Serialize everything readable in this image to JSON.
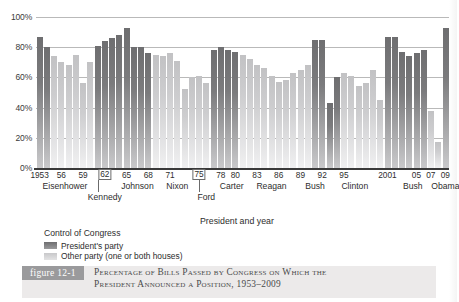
{
  "chart_data": {
    "type": "bar",
    "title": "Percentage of Bills Passed by Congress on Which the President Announced a Position, 1953–2009",
    "xlabel": "President and year",
    "ylabel": "",
    "ylim": [
      0,
      100
    ],
    "yticks": [
      "0%",
      "20%",
      "40%",
      "60%",
      "80%",
      "100%"
    ],
    "grid": true,
    "legend_position": "below-axis-left",
    "series_names": [
      "President's party",
      "Other party (one or both houses)"
    ],
    "categories": [
      "1953",
      "1954",
      "1955",
      "1956",
      "1957",
      "1958",
      "1959",
      "1960",
      "1961",
      "1962",
      "1963",
      "1964",
      "1965",
      "1966",
      "1967",
      "1968",
      "1969",
      "1970",
      "1971",
      "1972",
      "1973",
      "1974",
      "1975",
      "1976",
      "1977",
      "1978",
      "1979",
      "1980",
      "1981",
      "1982",
      "1983",
      "1984",
      "1985",
      "1986",
      "1987",
      "1988",
      "1989",
      "1990",
      "1991",
      "1992",
      "1993",
      "1994",
      "1995",
      "1996",
      "1997",
      "1998",
      "1999",
      "2000",
      "2001",
      "2002",
      "2003",
      "2004",
      "2005",
      "2006",
      "2007",
      "2008",
      "2009"
    ],
    "values": [
      87,
      80,
      74,
      70,
      68,
      75,
      56,
      70,
      81,
      84,
      86,
      88,
      93,
      80,
      80,
      76,
      75,
      74,
      76,
      71,
      52,
      60,
      61,
      56,
      78,
      80,
      78,
      77,
      75,
      72,
      68,
      66,
      61,
      57,
      58,
      63,
      65,
      68,
      85,
      85,
      43,
      60,
      63,
      61,
      54,
      56,
      65,
      45,
      87,
      87,
      77,
      74,
      76,
      78,
      38,
      17,
      93
    ],
    "party_control": [
      "president",
      "president",
      "other",
      "other",
      "other",
      "other",
      "other",
      "other",
      "president",
      "president",
      "president",
      "president",
      "president",
      "president",
      "president",
      "president",
      "other",
      "other",
      "other",
      "other",
      "other",
      "other",
      "other",
      "other",
      "president",
      "president",
      "president",
      "president",
      "other",
      "other",
      "other",
      "other",
      "other",
      "other",
      "other",
      "other",
      "other",
      "other",
      "president",
      "president",
      "president",
      "president",
      "other",
      "other",
      "other",
      "other",
      "other",
      "other",
      "president",
      "president",
      "president",
      "president",
      "president",
      "president",
      "other",
      "other",
      "president"
    ],
    "year_ticks": [
      {
        "label": "1953",
        "index": 0,
        "boxed": false
      },
      {
        "label": "56",
        "index": 3,
        "boxed": false
      },
      {
        "label": "59",
        "index": 6,
        "boxed": false
      },
      {
        "label": "62",
        "index": 9,
        "boxed": true
      },
      {
        "label": "65",
        "index": 12,
        "boxed": false
      },
      {
        "label": "68",
        "index": 15,
        "boxed": false
      },
      {
        "label": "71",
        "index": 18,
        "boxed": false
      },
      {
        "label": "75",
        "index": 22,
        "boxed": true
      },
      {
        "label": "78",
        "index": 25,
        "boxed": false
      },
      {
        "label": "80",
        "index": 27,
        "boxed": false
      },
      {
        "label": "83",
        "index": 30,
        "boxed": false
      },
      {
        "label": "86",
        "index": 33,
        "boxed": false
      },
      {
        "label": "89",
        "index": 36,
        "boxed": false
      },
      {
        "label": "92",
        "index": 39,
        "boxed": false
      },
      {
        "label": "95",
        "index": 42,
        "boxed": false
      },
      {
        "label": "2001",
        "index": 48,
        "boxed": false
      },
      {
        "label": "05",
        "index": 52,
        "boxed": false
      },
      {
        "label": "07",
        "index": 54,
        "boxed": false
      },
      {
        "label": "09",
        "index": 56,
        "boxed": false
      }
    ],
    "president_labels": [
      {
        "name": "Eisenhower",
        "center_index": 3.5,
        "row": 1
      },
      {
        "name": "Kennedy",
        "center_index": 9.0,
        "row": 2
      },
      {
        "name": "Johnson",
        "center_index": 13.5,
        "row": 1
      },
      {
        "name": "Nixon",
        "center_index": 19.0,
        "row": 1
      },
      {
        "name": "Ford",
        "center_index": 23.0,
        "row": 2
      },
      {
        "name": "Carter",
        "center_index": 26.5,
        "row": 1
      },
      {
        "name": "Reagan",
        "center_index": 32.0,
        "row": 1
      },
      {
        "name": "Bush",
        "center_index": 38.0,
        "row": 1
      },
      {
        "name": "Clinton",
        "center_index": 43.5,
        "row": 1
      },
      {
        "name": "Bush",
        "center_index": 51.5,
        "row": 1
      },
      {
        "name": "Obama",
        "center_index": 56.0,
        "row": 1
      }
    ],
    "president_dividers": [
      8.0,
      22.0
    ]
  },
  "legend": {
    "title": "Control of Congress",
    "items": [
      {
        "label": "President's party",
        "color": "#7b7b7d"
      },
      {
        "label": "Other party (one or both houses)",
        "color": "#cdcdcf"
      }
    ]
  },
  "caption": {
    "figure_label": "figure 12-1",
    "line1": "Percentage of Bills Passed by Congress on Which the",
    "line2": "President Announced a Position, 1953–2009"
  },
  "colors": {
    "president_party": "#7b7b7d",
    "other_party": "#cdcdcf",
    "gridline": "#b9b9b9",
    "axis": "#3a3a3a",
    "caption_band": "#eceaea",
    "badge": "#9a9a9c"
  }
}
